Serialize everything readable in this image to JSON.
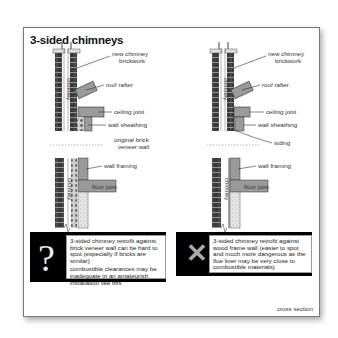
{
  "title": "3-sided chimneys",
  "left_diagram": {
    "chimney_label_top": "chimney",
    "chimney_label_bottom": "chimney",
    "labels": {
      "new_chimney_1": "new chimney",
      "new_chimney_2": "brickwork",
      "roof_rafter": "roof rafter",
      "ceiling_joist": "ceiling joist",
      "wall_sheathing": "wall sheathing",
      "original_1": "original brick",
      "original_2": "veneer wall",
      "wall_framing": "wall framing",
      "floor_joist": "floor joist"
    },
    "note": {
      "symbol": "?",
      "text1": "3-sided chimney retrofit against brick veneer wall can be hard to spot (especially if bricks are similar)",
      "text2": "combustible clearances may be inadequate in an amateurish installation like this"
    }
  },
  "right_diagram": {
    "chimney_label_top": "chimney",
    "chimney_label_bottom": "chimney",
    "labels": {
      "new_chimney_1": "new chimney",
      "new_chimney_2": "brickwork",
      "roof_rafter": "roof rafter",
      "ceiling_joist": "ceiling joist",
      "wall_sheathing": "wall sheathing",
      "siding": "siding",
      "wall_framing": "wall framing",
      "floor_joist": "floor joist"
    },
    "note": {
      "symbol": "✕",
      "text": "3-sided chimney retrofit against wood frame wall (easier to spot and much more dangerous as the flue liner may be very close to combustible materials)"
    }
  },
  "caption": "cross section",
  "colors": {
    "brick": "#3a3a3a",
    "wood": "#9a9a9a",
    "note_bg": "#000000",
    "border": "#777777"
  }
}
